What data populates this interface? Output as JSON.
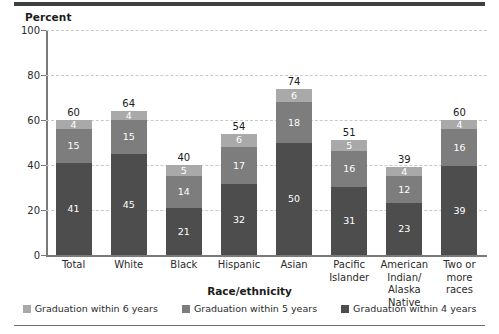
{
  "chart_data": {
    "type": "bar",
    "stacked": true,
    "title": "",
    "xlabel": "Race/ethnicity",
    "ylabel": "Percent",
    "ylim": [
      0,
      100
    ],
    "yticks": [
      0,
      20,
      40,
      60,
      80,
      100
    ],
    "grid": "horizontal-dashed",
    "legend_position": "bottom",
    "categories": [
      "Total",
      "White",
      "Black",
      "Hispanic",
      "Asian",
      "Pacific Islander",
      "American Indian/ Alaska Native",
      "Two or more races"
    ],
    "category_lines": [
      [
        "Total"
      ],
      [
        "White"
      ],
      [
        "Black"
      ],
      [
        "Hispanic"
      ],
      [
        "Asian"
      ],
      [
        "Pacific",
        "Islander"
      ],
      [
        "American",
        "Indian/",
        "Alaska Native"
      ],
      [
        "Two or",
        "more races"
      ]
    ],
    "series": [
      {
        "name": "Graduation within 4 years",
        "color": "#4d4d4d",
        "values": [
          41,
          45,
          21,
          32,
          50,
          31,
          23,
          39
        ]
      },
      {
        "name": "Graduation within 5 years",
        "color": "#7d7d7d",
        "values": [
          15,
          15,
          14,
          17,
          18,
          16,
          12,
          16
        ]
      },
      {
        "name": "Graduation within 6 years",
        "color": "#a9a9a9",
        "values": [
          4,
          4,
          5,
          6,
          6,
          5,
          4,
          4
        ]
      }
    ],
    "totals": [
      60,
      64,
      40,
      54,
      74,
      51,
      39,
      60
    ]
  },
  "legend": {
    "items": [
      {
        "label": "Graduation within 6 years",
        "color": "#a9a9a9"
      },
      {
        "label": "Graduation within 5 years",
        "color": "#7d7d7d"
      },
      {
        "label": "Graduation within 4 years",
        "color": "#4d4d4d"
      }
    ]
  },
  "axes": {
    "y_title": "Percent",
    "x_title": "Race/ethnicity",
    "y_tick_labels": [
      "100",
      "80",
      "60",
      "40",
      "20",
      "0"
    ]
  }
}
